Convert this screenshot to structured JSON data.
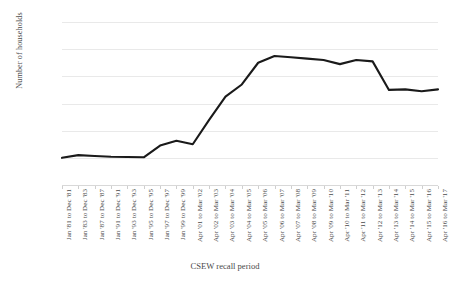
{
  "chart_data": {
    "type": "line",
    "title": "",
    "xlabel": "CSEW recall period",
    "ylabel": "Number of households",
    "ylim": [
      0,
      60000
    ],
    "ytick_values": [
      0,
      10000,
      20000,
      30000,
      40000,
      50000,
      60000
    ],
    "ytick_labels": [
      "0",
      "10,000",
      "20,000",
      "30,000",
      "40,000",
      "50,000",
      "60,000"
    ],
    "grid": true,
    "legend": "none",
    "line_color": "#1a1a1a",
    "line_width": 2.1,
    "categories": [
      "Jan '81 to Dec '81",
      "Jan '83 to Dec '83",
      "Jan '87 to Dec '87",
      "Jan '91 to Dec '91",
      "Jan '93 to Dec '93",
      "Jan '95 to Dec '95",
      "Jan '97 to Dec '97",
      "Jan '99 to Dec '99",
      "Apr '01 to Mar '02",
      "Apr '02 to Mar '03",
      "Apr '03 to Mar '04",
      "Apr '04 to Mar '05",
      "Apr '05 to Mar '06",
      "Apr '06 to Mar '07",
      "Apr '07 to Mar '08",
      "Apr '08 to Mar '09",
      "Apr '09 to Mar '10",
      "Apr '10 to Mar '11",
      "Apr '11 to Mar '12",
      "Apr '12 to Mar '13",
      "Apr '13 to Mar '14",
      "Apr '14 to Mar '15",
      "Apr '15 to Mar '16",
      "Apr '16 to Mar '17"
    ],
    "values": [
      10000,
      11000,
      10700,
      10400,
      10300,
      10200,
      14500,
      16300,
      15000,
      24000,
      32500,
      37000,
      45000,
      47500,
      47000,
      46500,
      46000,
      44500,
      46000,
      45500,
      35000,
      35200,
      34500,
      35200
    ]
  }
}
